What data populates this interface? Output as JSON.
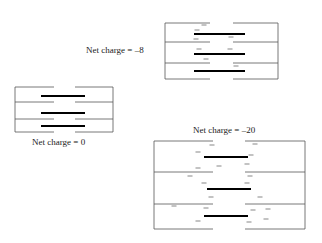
{
  "panels": [
    {
      "id": "net-charge-minus-8",
      "label": "Net charge = –8",
      "label_pos": [
        86,
        53
      ],
      "box": {
        "x1": 165,
        "x2": 278,
        "y_top": 23,
        "y_bottom": 79,
        "dividers": [
          42,
          63
        ],
        "gap": [
          210,
          233
        ]
      },
      "bars": [
        [
          194,
          245,
          34
        ],
        [
          194,
          245,
          54
        ],
        [
          194,
          245,
          71
        ]
      ],
      "charges": [
        [
          204,
          25
        ],
        [
          197,
          30
        ],
        [
          196,
          39
        ],
        [
          231,
          37
        ],
        [
          199,
          49
        ],
        [
          230,
          49
        ],
        [
          206,
          59
        ],
        [
          236,
          66
        ]
      ]
    },
    {
      "id": "net-charge-0",
      "label": "Net charge = 0",
      "label_pos": [
        32,
        145
      ],
      "box": {
        "x1": 15,
        "x2": 113,
        "y_top": 87,
        "y_bottom": 132,
        "dividers": [
          102,
          119
        ],
        "gap": [
          54,
          75
        ]
      },
      "bars": [
        [
          41,
          85,
          96
        ],
        [
          41,
          85,
          113
        ],
        [
          41,
          85,
          126
        ]
      ],
      "charges": []
    },
    {
      "id": "net-charge-minus-20",
      "label": "Net charge = –20",
      "label_pos": [
        193,
        133
      ],
      "box": {
        "x1": 154,
        "x2": 305,
        "y_top": 141,
        "y_bottom": 229,
        "dividers": [
          172,
          204
        ],
        "gap": [
          213,
          245
        ]
      },
      "bars": [
        [
          204,
          248,
          157
        ],
        [
          207,
          251,
          189
        ],
        [
          204,
          248,
          216
        ]
      ],
      "charges": [
        [
          212,
          145
        ],
        [
          255,
          144
        ],
        [
          198,
          152
        ],
        [
          251,
          155
        ],
        [
          219,
          166
        ],
        [
          247,
          164
        ],
        [
          198,
          168
        ],
        [
          190,
          176
        ],
        [
          250,
          176
        ],
        [
          204,
          183
        ],
        [
          247,
          183
        ],
        [
          211,
          197
        ],
        [
          260,
          197
        ],
        [
          174,
          206
        ],
        [
          206,
          208
        ],
        [
          253,
          210
        ],
        [
          268,
          209
        ],
        [
          198,
          221
        ],
        [
          266,
          219
        ],
        [
          249,
          222
        ]
      ]
    }
  ]
}
